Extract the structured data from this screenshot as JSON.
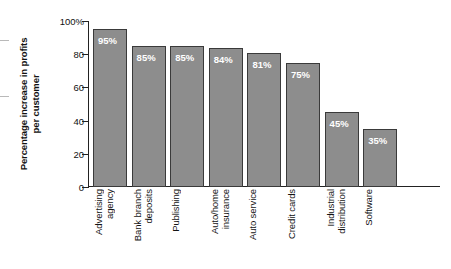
{
  "chart_data": {
    "type": "bar",
    "title": "",
    "xlabel": "",
    "ylabel": "Percentage increase in profits per customer",
    "ylabel_lines": [
      "Percentage increase in profits",
      "per customer"
    ],
    "categories": [
      "Advertising agency",
      "Bank branch deposits",
      "Publishing",
      "Auto/home insurance",
      "Auto service",
      "Credit cards",
      "Industrial distribution",
      "Software"
    ],
    "category_lines": [
      [
        "Advertising",
        "agency"
      ],
      [
        "Bank branch",
        "deposits"
      ],
      [
        "Publishing"
      ],
      [
        "Auto/home",
        "insurance"
      ],
      [
        "Auto service"
      ],
      [
        "Credit cards"
      ],
      [
        "Industrial",
        "distribution"
      ],
      [
        "Software"
      ]
    ],
    "values": [
      95,
      85,
      85,
      84,
      81,
      75,
      45,
      35
    ],
    "value_labels": [
      "95%",
      "85%",
      "85%",
      "84%",
      "81%",
      "75%",
      "45%",
      "35%"
    ],
    "ylim": [
      0,
      100
    ],
    "yticks": [
      0,
      20,
      40,
      60,
      80,
      100
    ],
    "ytick_labels": [
      "0",
      "20",
      "40",
      "60",
      "80",
      "100%"
    ],
    "grid": false,
    "legend": null,
    "bar_color": "#8d8d8d",
    "bar_edge_color": "#3a3a3a",
    "value_label_color": "#ffffff",
    "axis_color": "#222222",
    "background_color": "#ffffff"
  }
}
